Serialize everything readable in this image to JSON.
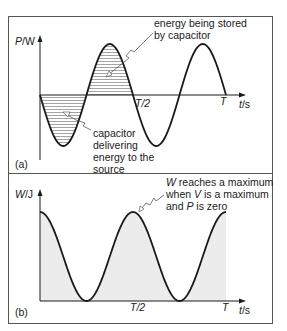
{
  "panel_a": {
    "label": "(a)",
    "y_axis": {
      "var": "P",
      "unit": "/W"
    },
    "x_axis": {
      "var": "t",
      "unit": "/s"
    },
    "ticks": [
      {
        "label": "T/2"
      },
      {
        "label": "T"
      }
    ],
    "annotations": {
      "stored": [
        "energy being stored",
        "by capacitor"
      ],
      "delivering": [
        "capacitor",
        "delivering",
        "energy to the",
        "source"
      ]
    },
    "curve": "P = -sin(2ωt), two full cycles over 0..T; positive lobes hatched (energy stored), negative lobes hatched (energy delivered)"
  },
  "panel_b": {
    "label": "(b)",
    "y_axis": {
      "var": "W",
      "unit": "/J"
    },
    "x_axis": {
      "var": "t",
      "unit": "/s"
    },
    "ticks": [
      {
        "label": "T/2"
      },
      {
        "label": "T"
      }
    ],
    "annotation": {
      "line1_var": "W",
      "line1_rest": " reaches a maximum",
      "line2_pre": "when ",
      "line2_var": "V",
      "line2_rest": " is a maximum",
      "line3_pre": "and ",
      "line3_var": "P",
      "line3_rest": " is zero"
    },
    "curve": "W ∝ cos²(ωt), max at t=0, T/2, T; min at T/4, 3T/4; area under curve shaded"
  },
  "colors": {
    "line": "#1a1a1a",
    "frame": "#555555",
    "shade": "#ececec",
    "hatch": "#555555"
  }
}
